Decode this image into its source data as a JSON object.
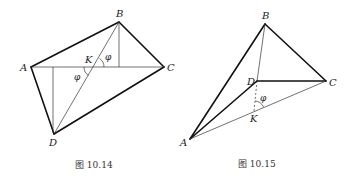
{
  "figures": [
    {
      "caption": "图 10.14",
      "points": {
        "A": {
          "label": "A",
          "x": 31,
          "y": 67
        },
        "B": {
          "label": "B",
          "x": 119,
          "y": 22
        },
        "C": {
          "label": "C",
          "x": 164,
          "y": 67
        },
        "D": {
          "label": "D",
          "x": 54,
          "y": 134
        },
        "K": {
          "label": "K",
          "x": 94,
          "y": 67
        }
      },
      "angle_label": "φ",
      "angle_label_2": "φ"
    },
    {
      "caption": "图 10.15",
      "points": {
        "A": {
          "label": "A",
          "x": 190,
          "y": 139
        },
        "B": {
          "label": "B",
          "x": 265,
          "y": 24
        },
        "C": {
          "label": "C",
          "x": 326,
          "y": 81
        },
        "D": {
          "label": "D",
          "x": 257,
          "y": 81
        },
        "K": {
          "label": "K",
          "x": 254,
          "y": 111
        }
      },
      "angle_label": "φ"
    }
  ]
}
